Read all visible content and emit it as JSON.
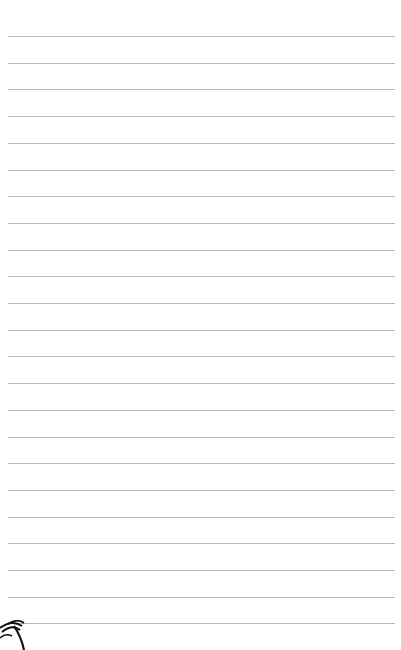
{
  "page": {
    "type": "lined-notepaper",
    "background_color": "#ffffff",
    "rule_color": "#b9b9b9",
    "rule_count": 23,
    "rule_start_y": 36,
    "rule_spacing": 26.7,
    "rule_left": 8,
    "rule_right": 395,
    "lines": [
      "",
      "",
      "",
      "",
      "",
      "",
      "",
      "",
      "",
      "",
      "",
      "",
      "",
      "",
      "",
      "",
      "",
      "",
      "",
      "",
      "",
      "",
      ""
    ]
  },
  "decoration": {
    "icon": "palm-tree-icon",
    "position": "bottom-left"
  }
}
